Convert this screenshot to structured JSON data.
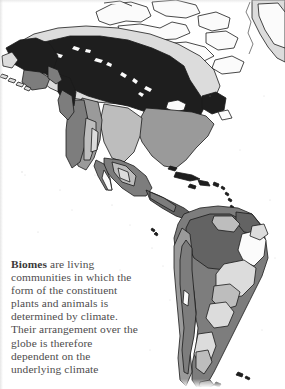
{
  "page": {
    "width": 285,
    "height": 389,
    "background_color": "#fefefe",
    "kind": "scanned-atlas-page"
  },
  "caption": {
    "lead_word": "Biomes",
    "body_text": " are living communities in which the form of the constituent plants and animals is determined by climate. Their arrangement over the globe is therefore dependent on the underlying climate",
    "full_text": "Biomes are living communities in which the form of the constituent plants and animals is determined by climate. Their arrangement over the globe is therefore dependent on the underlying climate",
    "lines": [
      "Biomes are living",
      "communities in which",
      "the form of the",
      "constituent plants and",
      "animals is determined",
      "by climate. Their",
      "arrangement over the",
      "globe is therefore",
      "dependent on the",
      "underlying climate"
    ],
    "text_color": "#4e4c4d",
    "lead_color": "#3a3839",
    "truncated_at_bottom": true
  },
  "map": {
    "title": "Biomes of the Americas",
    "projection_note": "Americas, North and South, with Greenland at upper right",
    "ocean_color": "#ffffff",
    "outline_color": "#1b1b1b",
    "regions_labels": [
      "Alaska",
      "Canadian Arctic Archipelago",
      "Greenland",
      "Western Cordillera",
      "Great Plains",
      "Eastern North America",
      "Mexico",
      "Central America",
      "Caribbean Islands",
      "Amazon Basin",
      "Brazilian Highlands",
      "Andes",
      "Patagonia"
    ],
    "legend": {
      "title": "Biome shading",
      "entries": [
        {
          "name": "ice-cap-and-polar-desert",
          "color": "#fafafa",
          "label": "Ice cap / polar desert"
        },
        {
          "name": "tundra",
          "color": "#dcdcdc",
          "label": "Tundra"
        },
        {
          "name": "temperate-grassland",
          "color": "#bdbdbd",
          "label": "Temperate grassland"
        },
        {
          "name": "temperate-forest",
          "color": "#9a9a9a",
          "label": "Temperate forest"
        },
        {
          "name": "tropical-savanna",
          "color": "#7d7d7d",
          "label": "Tropical savanna / scrub"
        },
        {
          "name": "tropical-rainforest",
          "color": "#636363",
          "label": "Tropical rainforest"
        },
        {
          "name": "boreal-forest-taiga",
          "color": "#1e1e1e",
          "label": "Boreal forest (taiga)"
        }
      ]
    }
  }
}
